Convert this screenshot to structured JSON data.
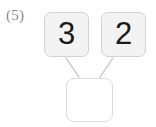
{
  "problem": {
    "label": "(5)",
    "type": "number-bond-addition",
    "addends": [
      {
        "value": "3"
      },
      {
        "value": "2"
      }
    ],
    "sum": {
      "value": "",
      "filled": false
    }
  },
  "colors": {
    "page_background": "#ffffff",
    "addend_box_fill": "#f3f3f3",
    "addend_box_border": "#d2d2d2",
    "sum_box_fill": "#ffffff",
    "sum_box_border": "#dcdcdc",
    "connector_line": "#bdbdbd",
    "digit_text": "#1a1a1a",
    "label_text": "#8a8a8a"
  }
}
